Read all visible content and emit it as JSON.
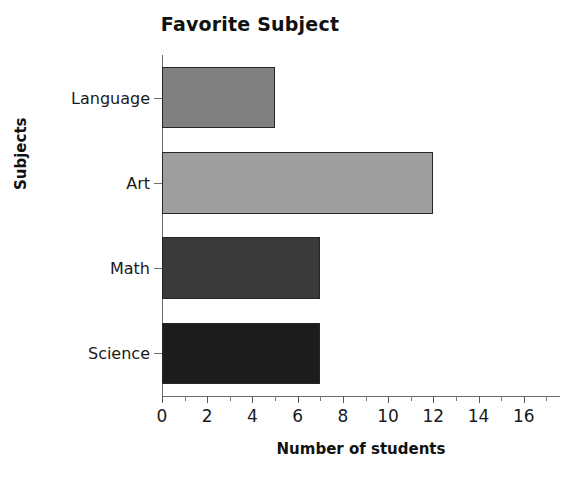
{
  "chart_data": {
    "type": "bar",
    "orientation": "horizontal",
    "title": "Favorite Subject",
    "xlabel": "Number of students",
    "ylabel": "Subjects",
    "categories": [
      "Language",
      "Art",
      "Math",
      "Science"
    ],
    "values": [
      5,
      12,
      7,
      7
    ],
    "bar_colors": [
      "#808080",
      "#9e9e9e",
      "#3a3a3a",
      "#1c1c1c"
    ],
    "bar_edge_color": "#262626",
    "xlim": [
      0,
      17.6
    ],
    "ylim_categories": 4,
    "xticks": [
      0,
      2,
      4,
      6,
      8,
      10,
      12,
      14,
      16
    ],
    "xtick_labels": [
      "0",
      "2",
      "4",
      "6",
      "8",
      "10",
      "12",
      "14",
      "16"
    ],
    "xticks_minor": [
      1,
      3,
      5,
      7,
      9,
      11,
      13,
      15,
      17
    ],
    "grid": false,
    "legend": null,
    "axis_color": "#6e6e6e",
    "background": "#ffffff",
    "series": [
      {
        "name": "Number of students",
        "points": [
          {
            "category": "Language",
            "value": 5,
            "color": "#808080"
          },
          {
            "category": "Art",
            "value": 12,
            "color": "#9e9e9e"
          },
          {
            "category": "Math",
            "value": 7,
            "color": "#3a3a3a"
          },
          {
            "category": "Science",
            "value": 7,
            "color": "#1c1c1c"
          }
        ]
      }
    ]
  }
}
